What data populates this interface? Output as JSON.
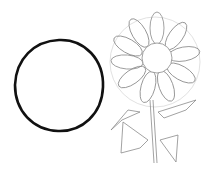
{
  "scene": {
    "description": "Pencil sketch: a bold hand-drawn circle on the left and an outline drawing of a sunflower with leaves on the right",
    "background": "#ffffff",
    "circle": {
      "stroke": "#111111",
      "stroke_width": 2.6,
      "cx": 59,
      "cy": 86,
      "rx": 44,
      "ry": 46
    },
    "sunflower": {
      "stroke": "#8a8a8a",
      "guide_circle": {
        "cx": 155,
        "cy": 60,
        "r": 45,
        "stroke": "#d6d6d6"
      },
      "disc": {
        "cx": 157,
        "cy": 58,
        "r": 15
      },
      "petal_count": 12,
      "stem": {
        "x1": 151,
        "y1": 100,
        "x2": 156,
        "y2": 163
      }
    }
  }
}
